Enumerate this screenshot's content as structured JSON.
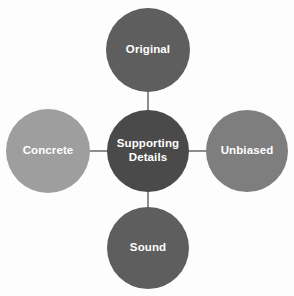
{
  "diagram": {
    "type": "hub-and-spoke",
    "background_color": "#fdfdfd",
    "connector_color": "#8d8d8d",
    "label_color": "#ffffff",
    "center": {
      "label": "Supporting Details",
      "line1": "Supporting",
      "line2": "Details",
      "color": "#4a4a4a",
      "cx": 148,
      "cy": 151,
      "r": 41
    },
    "nodes": [
      {
        "id": "original",
        "label": "Original",
        "color": "#5e5e5e",
        "position": "top",
        "cx": 148,
        "cy": 50,
        "r": 42
      },
      {
        "id": "unbiased",
        "label": "Unbiased",
        "color": "#7e7e7e",
        "position": "right",
        "cx": 247,
        "cy": 151,
        "r": 41
      },
      {
        "id": "sound",
        "label": "Sound",
        "color": "#5e5e5e",
        "position": "bottom",
        "cx": 148,
        "cy": 248,
        "r": 41
      },
      {
        "id": "concrete",
        "label": "Concrete",
        "color": "#9e9e9e",
        "position": "left",
        "cx": 48,
        "cy": 151,
        "r": 42
      }
    ]
  }
}
